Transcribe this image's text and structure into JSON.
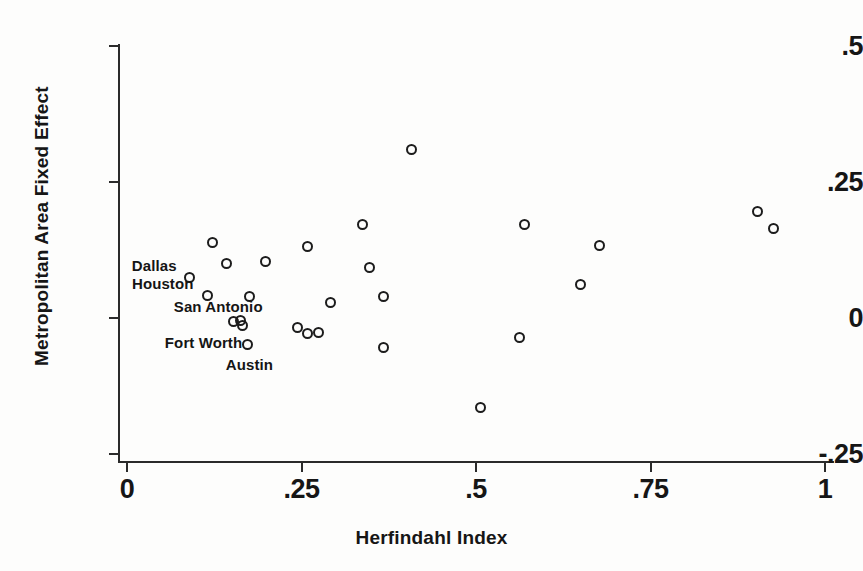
{
  "chart_data": {
    "type": "scatter",
    "title": "",
    "xlabel": "Herfindahl Index",
    "ylabel": "Metropolitan Area Fixed Effect",
    "xlim": [
      0,
      1
    ],
    "ylim": [
      -0.25,
      0.5
    ],
    "grid": false,
    "legend": "none",
    "marker_style": "open-circle",
    "xticks": [
      {
        "value": 0,
        "label": "0"
      },
      {
        "value": 0.25,
        "label": ".25"
      },
      {
        "value": 0.5,
        "label": ".5"
      },
      {
        "value": 0.75,
        "label": ".75"
      },
      {
        "value": 1,
        "label": "1"
      }
    ],
    "yticks": [
      {
        "value": 0.5,
        "label": ".5"
      },
      {
        "value": 0.25,
        "label": ".25"
      },
      {
        "value": 0,
        "label": "0"
      },
      {
        "value": -0.25,
        "label": "-.25"
      }
    ],
    "points": [
      {
        "x": 0.122,
        "y": 0.138,
        "label": ""
      },
      {
        "x": 0.143,
        "y": 0.101,
        "label": ""
      },
      {
        "x": 0.09,
        "y": 0.075,
        "label": "Dallas",
        "label_dx": -58,
        "label_dy": -20
      },
      {
        "x": 0.116,
        "y": 0.042,
        "label": "Houston",
        "label_dx": -76,
        "label_dy": -20
      },
      {
        "x": 0.198,
        "y": 0.103,
        "label": ""
      },
      {
        "x": 0.175,
        "y": 0.04,
        "label": ""
      },
      {
        "x": 0.258,
        "y": 0.131,
        "label": ""
      },
      {
        "x": 0.153,
        "y": -0.007,
        "label": "San Antonio",
        "label_dx": -60,
        "label_dy": -24
      },
      {
        "x": 0.162,
        "y": -0.005,
        "label": ""
      },
      {
        "x": 0.173,
        "y": -0.048,
        "label": "Austin",
        "label_dx": -22,
        "label_dy": 12
      },
      {
        "x": 0.166,
        "y": -0.014,
        "label": "Fort Worth",
        "label_dx": -78,
        "label_dy": 8
      },
      {
        "x": 0.244,
        "y": -0.018,
        "label": ""
      },
      {
        "x": 0.258,
        "y": -0.029,
        "label": ""
      },
      {
        "x": 0.275,
        "y": -0.026,
        "label": ""
      },
      {
        "x": 0.291,
        "y": 0.028,
        "label": ""
      },
      {
        "x": 0.338,
        "y": 0.171,
        "label": ""
      },
      {
        "x": 0.347,
        "y": 0.092,
        "label": ""
      },
      {
        "x": 0.367,
        "y": 0.04,
        "label": ""
      },
      {
        "x": 0.367,
        "y": -0.055,
        "label": ""
      },
      {
        "x": 0.407,
        "y": 0.309,
        "label": ""
      },
      {
        "x": 0.507,
        "y": -0.164,
        "label": ""
      },
      {
        "x": 0.563,
        "y": -0.035,
        "label": ""
      },
      {
        "x": 0.57,
        "y": 0.171,
        "label": ""
      },
      {
        "x": 0.649,
        "y": 0.061,
        "label": ""
      },
      {
        "x": 0.677,
        "y": 0.134,
        "label": ""
      },
      {
        "x": 0.904,
        "y": 0.195,
        "label": ""
      },
      {
        "x": 0.926,
        "y": 0.164,
        "label": ""
      }
    ]
  },
  "axes": {
    "x_title": "Herfindahl Index",
    "y_title": "Metropolitan Area Fixed Effect"
  },
  "colors": {
    "marker": "#1c1c1c",
    "axis": "#2b2b2b",
    "text": "#161616",
    "background": "#fdfdfc"
  }
}
